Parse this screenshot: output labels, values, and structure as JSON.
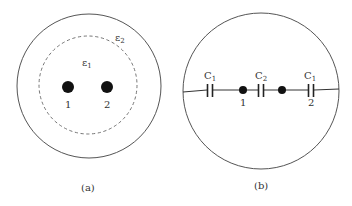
{
  "panel_a": {
    "caption": "(a)",
    "outer_region_label": "ε",
    "outer_region_sub": "2",
    "inner_region_label": "ε",
    "inner_region_sub": "1",
    "conductors": [
      {
        "label": "1"
      },
      {
        "label": "2"
      }
    ]
  },
  "panel_b": {
    "caption": "(b)",
    "capacitors": [
      {
        "label": "C",
        "sub": "1"
      },
      {
        "label": "C",
        "sub": "2"
      },
      {
        "label": "C",
        "sub": "1"
      }
    ],
    "nodes": [
      {
        "label": "1"
      },
      {
        "label": "2"
      }
    ]
  },
  "colors": {
    "stroke": "#555555",
    "dot": "#111111",
    "text": "#333333"
  }
}
